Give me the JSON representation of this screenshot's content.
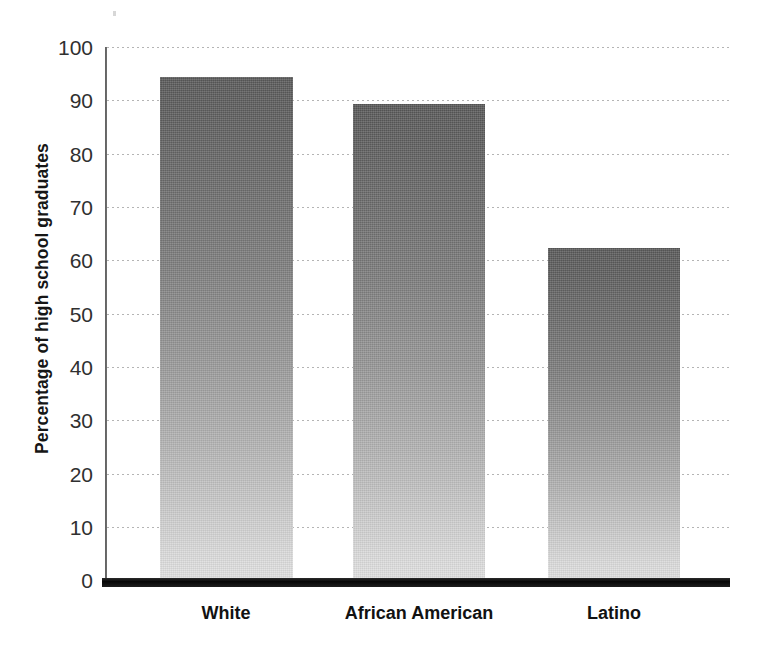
{
  "chart_data": {
    "type": "bar",
    "title": "",
    "subtitle": "",
    "xlabel": "",
    "ylabel": "Percentage of high school graduates",
    "categories": [
      "White",
      "African American",
      "Latino"
    ],
    "values": [
      94,
      89,
      62
    ],
    "series": [
      {
        "name": "Percentage of high school graduates",
        "values": [
          94,
          89,
          62
        ]
      }
    ],
    "ylim": [
      0,
      100
    ],
    "y_ticks": [
      0,
      10,
      20,
      30,
      40,
      50,
      60,
      70,
      80,
      90,
      100
    ],
    "y_tick_labels": [
      "0",
      "10",
      "20",
      "30",
      "40",
      "50",
      "60",
      "70",
      "80",
      "90",
      "100"
    ],
    "grid": "horizontal-dotted",
    "legend": "none",
    "annotations": [],
    "colors": {
      "bar_top": "#585858",
      "bar_bottom": "#e0e0e0",
      "axis": "#0a0a0a",
      "gridline": "#b4b4b4",
      "text": "#121212",
      "background": "#ffffff"
    }
  }
}
